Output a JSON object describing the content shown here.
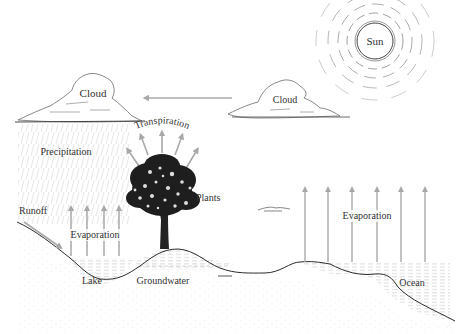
{
  "diagram": {
    "title": "",
    "type": "water-cycle",
    "colors": {
      "line": "#2a2a2a",
      "arrow": "#a8a8a8",
      "text": "#333333",
      "rain": "#c4c4c4",
      "water_hatch": "#bdbdbd",
      "ground_dots": "#d0d0d0"
    },
    "labels": {
      "sun": "Sun",
      "cloud_left": "Cloud",
      "cloud_right": "Cloud",
      "precipitation": "Precipitation",
      "transpiration": "Transpiration",
      "plants": "Plants",
      "runoff": "Runoff",
      "evaporation_lake": "Evaporation",
      "evaporation_ocean": "Evaporation",
      "lake": "Lake",
      "groundwater": "Groundwater",
      "ocean": "Ocean"
    },
    "nodes": [
      {
        "id": "sun",
        "label": "Sun"
      },
      {
        "id": "cloud_right",
        "label": "Cloud"
      },
      {
        "id": "cloud_left",
        "label": "Cloud"
      },
      {
        "id": "plants",
        "label": "Plants"
      },
      {
        "id": "lake",
        "label": "Lake"
      },
      {
        "id": "groundwater",
        "label": "Groundwater"
      },
      {
        "id": "ocean",
        "label": "Ocean"
      }
    ],
    "edges": [
      {
        "from": "cloud_right",
        "to": "cloud_left",
        "label": ""
      },
      {
        "from": "cloud_left",
        "to": "ground",
        "label": "Precipitation"
      },
      {
        "from": "plants",
        "to": "sky",
        "label": "Transpiration"
      },
      {
        "from": "ground",
        "to": "lake",
        "label": "Runoff"
      },
      {
        "from": "lake",
        "to": "sky",
        "label": "Evaporation"
      },
      {
        "from": "ocean",
        "to": "sky",
        "label": "Evaporation"
      }
    ]
  }
}
